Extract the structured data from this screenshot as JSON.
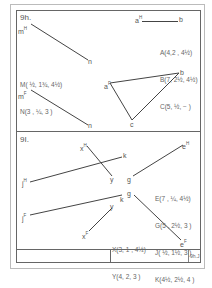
{
  "sheet": {
    "stroke_color": "#555555",
    "paper_color": "#ffffff",
    "title_block_code": "9h.J"
  },
  "problem_9h": {
    "number": "9h.",
    "line_mn": {
      "top_view": {
        "start_label": "m",
        "start_sup": "H",
        "end_label": "n"
      },
      "front_view": {
        "start_label": "m",
        "start_sup": "F",
        "end_label": "n"
      }
    },
    "line_ab_top": {
      "start_label": "a",
      "start_sup": "H",
      "end_label": "b"
    },
    "triangle_front": {
      "labels": [
        "a",
        "b",
        "c"
      ],
      "a_sup": "F"
    },
    "coordinates_mn": [
      "M( ½, 1¾, 4½)",
      "N(3 , ¼, 3 )"
    ],
    "coordinates_abc": [
      "A(4,2 , 4½)",
      "B(7, 2½, 4½)",
      "C(5, ½, − )"
    ]
  },
  "problem_9i": {
    "number": "9I.",
    "line_xy": {
      "top_view": {
        "start_label": "x",
        "start_sup": "H",
        "end_label": "y"
      },
      "front_view": {
        "start_label": "x",
        "start_sup": "F",
        "end_label": "y"
      }
    },
    "line_jk": {
      "top_view": {
        "start_label": "j",
        "start_sup": "H",
        "end_label": "k"
      },
      "front_view": {
        "start_label": "j",
        "start_sup": "F",
        "end_label": "k"
      }
    },
    "line_eg": {
      "top_view": {
        "start_label": "g",
        "end_label": "e",
        "end_sup": "H"
      },
      "front_view": {
        "start_label": "g",
        "end_label": "e",
        "end_sup": "F"
      }
    },
    "coordinates_egjk": [
      "E(7 , ¼, 4½)",
      "G(5 , 2½, 3 )",
      "J( ½, 1½, 3 )",
      "K(4½, 2½, 4 )"
    ],
    "coordinates_xy": [
      "X(3, 1 , 4½)",
      "Y(4, 2, 3 )"
    ]
  }
}
